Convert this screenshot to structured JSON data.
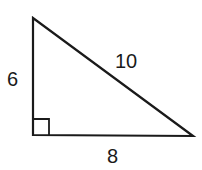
{
  "diagram": {
    "type": "right-triangle",
    "labels": {
      "left_leg": "6",
      "hypotenuse": "10",
      "bottom_leg": "8"
    },
    "vertices": {
      "top": [
        33,
        18
      ],
      "right_angle": [
        33,
        135
      ],
      "bottom_right": [
        193,
        136
      ]
    },
    "right_angle_marker": true,
    "stroke_color": "#1a1a1a",
    "background": "#ffffff"
  }
}
